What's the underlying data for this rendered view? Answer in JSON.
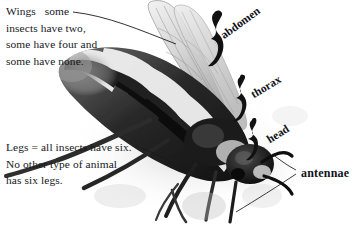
{
  "figure": {
    "background_color": "#ffffff",
    "ink_color": "#15181c"
  },
  "notes": [
    {
      "id": "wings",
      "lines": [
        "Wings   some",
        "insects have two,",
        "some have four and",
        "some have none."
      ],
      "text": "Wings   some\ninsects have two,\nsome have four and\nsome have none."
    },
    {
      "id": "legs",
      "lines": [
        "Legs = all insects have six.",
        "No other type of animal",
        "has six legs."
      ],
      "text": "Legs = all insects have six.\nNo other type of animal\nhas six legs."
    }
  ],
  "part_labels": {
    "abdomen": "abdomen",
    "thorax": "thorax",
    "head": "head",
    "antennae": "antennae"
  },
  "braces": [
    {
      "name": "abdomen-brace",
      "label": "abdomen"
    },
    {
      "name": "thorax-brace",
      "label": "thorax"
    },
    {
      "name": "head-brace",
      "label": "head"
    }
  ],
  "leader_lines": [
    {
      "name": "wings-leader",
      "from": "Wings note",
      "to": "wing"
    },
    {
      "name": "legs-leader",
      "from": "Legs note",
      "to": "leg"
    },
    {
      "name": "antennae-leader-upper",
      "from": "antennae label",
      "to": "antenna"
    },
    {
      "name": "antennae-leader-lower",
      "from": "antennae label",
      "to": "antenna"
    }
  ]
}
